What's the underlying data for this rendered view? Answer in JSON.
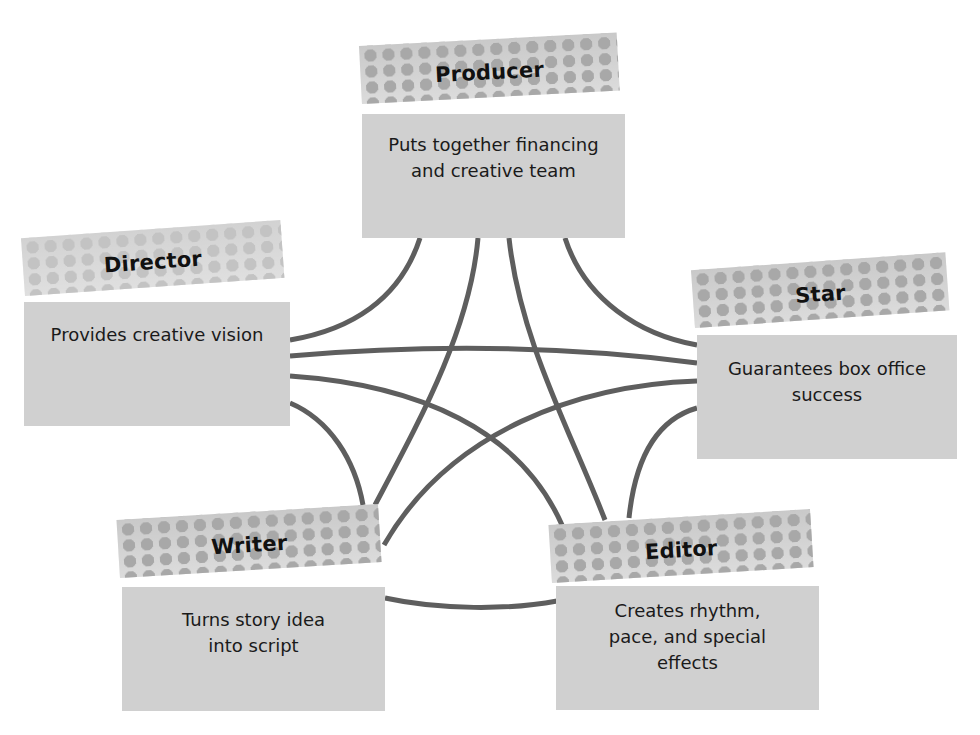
{
  "diagram": {
    "type": "network",
    "colors": {
      "box_fill": "#d0d0d0",
      "banner_fill": "#c9c9c9",
      "banner_dots": "#a8a8a8",
      "link_stroke": "#5e5e5e",
      "label_text": "#111111"
    },
    "nodes": [
      {
        "id": "producer",
        "title": "Producer",
        "description": "Puts together financing\nand creative team"
      },
      {
        "id": "director",
        "title": "Director",
        "description": "Provides creative vision"
      },
      {
        "id": "star",
        "title": "Star",
        "description": "Guarantees box office\nsuccess"
      },
      {
        "id": "writer",
        "title": "Writer",
        "description": "Turns story idea\ninto script"
      },
      {
        "id": "editor",
        "title": "Editor",
        "description": "Creates rhythm,\npace, and special\neffects"
      }
    ],
    "edges": [
      [
        "producer",
        "director"
      ],
      [
        "producer",
        "writer"
      ],
      [
        "producer",
        "editor"
      ],
      [
        "producer",
        "star"
      ],
      [
        "director",
        "star"
      ],
      [
        "director",
        "editor"
      ],
      [
        "director",
        "writer"
      ],
      [
        "star",
        "writer"
      ],
      [
        "star",
        "editor"
      ],
      [
        "writer",
        "editor"
      ]
    ]
  }
}
